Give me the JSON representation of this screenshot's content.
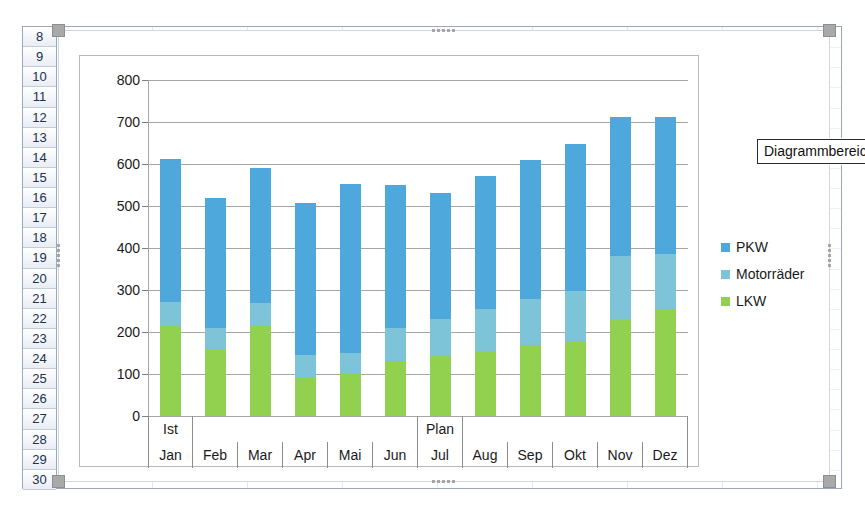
{
  "spreadsheet": {
    "row_headers": [
      "8",
      "9",
      "10",
      "11",
      "12",
      "13",
      "14",
      "15",
      "16",
      "17",
      "18",
      "19",
      "20",
      "21",
      "22",
      "23",
      "24",
      "25",
      "26",
      "27",
      "28",
      "29",
      "30"
    ]
  },
  "tooltip": {
    "label": "Diagrammbereich"
  },
  "legend": {
    "items": [
      {
        "label": "PKW",
        "color": "#4FA8DC"
      },
      {
        "label": "Motorräder",
        "color": "#7DC4D8"
      },
      {
        "label": "LKW",
        "color": "#92D050"
      }
    ]
  },
  "chart_data": {
    "type": "bar",
    "stacked": true,
    "title": "",
    "xlabel": "",
    "ylabel": "",
    "ylim": [
      0,
      800
    ],
    "yticks": [
      0,
      100,
      200,
      300,
      400,
      500,
      600,
      700,
      800
    ],
    "ytick_labels": [
      "0",
      "100",
      "200",
      "300",
      "400",
      "500",
      "600",
      "700",
      "800"
    ],
    "grid": true,
    "legend_position": "right",
    "categories": [
      "Jan",
      "Feb",
      "Mar",
      "Apr",
      "Mai",
      "Jun",
      "Jul",
      "Aug",
      "Sep",
      "Okt",
      "Nov",
      "Dez"
    ],
    "category_groups": [
      {
        "label": "Ist",
        "start": 0,
        "span": 1
      },
      {
        "label": "",
        "start": 1,
        "span": 5
      },
      {
        "label": "Plan",
        "start": 6,
        "span": 1
      },
      {
        "label": "",
        "start": 7,
        "span": 5
      }
    ],
    "series": [
      {
        "name": "LKW",
        "color": "#92D050",
        "values": [
          214,
          160,
          214,
          90,
          100,
          130,
          142,
          155,
          168,
          178,
          232,
          255
        ]
      },
      {
        "name": "Motorräder",
        "color": "#7DC4D8",
        "values": [
          57,
          50,
          54,
          55,
          50,
          80,
          88,
          100,
          110,
          120,
          150,
          130
        ]
      },
      {
        "name": "PKW",
        "color": "#4FA8DC",
        "values": [
          341,
          308,
          322,
          363,
          402,
          340,
          300,
          317,
          332,
          350,
          331,
          328
        ]
      }
    ],
    "totals": [
      612,
      518,
      590,
      508,
      552,
      550,
      530,
      572,
      610,
      648,
      713,
      713
    ]
  }
}
